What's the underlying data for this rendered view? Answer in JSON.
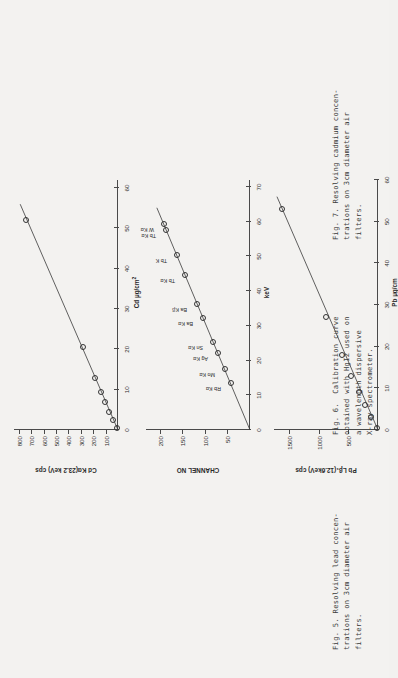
{
  "page": {
    "background": "#f3f2f0",
    "ink": "#333333",
    "orientation": "figures rotated 90 degrees counter-clockwise"
  },
  "figures": [
    {
      "id": "fig5",
      "caption_lines": [
        "Fig. 5. Resolving lead concen-",
        "trations on 3cm diameter air",
        "filters."
      ],
      "chart_data": {
        "type": "scatter",
        "title": "Fig. 5. Resolving lead concentrations on 3cm diameter air filters.",
        "xlabel": "Pb µg/cm",
        "ylabel": "Pb Lβ₁(12.6keV) cps",
        "xlim": [
          0,
          60
        ],
        "ylim": [
          0,
          1750
        ],
        "xticks": [
          0,
          10,
          20,
          30,
          40,
          50,
          60
        ],
        "yticks": [
          500,
          1000,
          1500
        ],
        "grid": false,
        "x": [
          0.5,
          3,
          6,
          9,
          13,
          18,
          27,
          53
        ],
        "y": [
          20,
          110,
          215,
          320,
          450,
          600,
          880,
          1610
        ],
        "fit_line": {
          "x0": 0,
          "y0": 0,
          "x1": 56,
          "y1": 1700
        }
      }
    },
    {
      "id": "fig6",
      "caption_lines": [
        "Fig. 6.  Calibration curve",
        "obtained with HgI2 used on",
        "a wavelength dispersive",
        "X-ray spectrometer."
      ],
      "chart_data": {
        "type": "scatter",
        "title": "Fig. 6. Calibration curve obtained with HgI2 used on a wavelength dispersive X-ray spectrometer.",
        "xlabel": "keV",
        "ylabel": "CHANNEL NO",
        "xlim": [
          0,
          72
        ],
        "ylim": [
          0,
          230
        ],
        "xticks": [
          0,
          10,
          20,
          30,
          40,
          50,
          60,
          70
        ],
        "yticks": [
          50,
          100,
          150,
          200
        ],
        "grid": false,
        "points": [
          {
            "label": "Rb Kα",
            "x": 13.4,
            "y": 42
          },
          {
            "label": "Mo Kα",
            "x": 17.5,
            "y": 56
          },
          {
            "label": "Ag Kα",
            "x": 22.2,
            "y": 71
          },
          {
            "label": "Sn Kα",
            "x": 25.3,
            "y": 81
          },
          {
            "label": "Ba Kα",
            "x": 32.2,
            "y": 103
          },
          {
            "label": "Ba Kβ",
            "x": 36.4,
            "y": 117
          },
          {
            "label": "Tb Kα",
            "x": 44.5,
            "y": 143
          },
          {
            "label": "Tb K",
            "x": 50.4,
            "y": 162
          },
          {
            "label": "Tb Kα",
            "x": 57.5,
            "y": 185
          },
          {
            "label": "W Kα",
            "x": 59.3,
            "y": 191
          }
        ],
        "fit_line": {
          "x0": 0,
          "y0": 0,
          "x1": 64,
          "y1": 206
        }
      }
    },
    {
      "id": "fig7",
      "caption_lines": [
        "Fig. 7. Resolving cadmium concen-",
        "trations on 3cm diameter air",
        "filters."
      ],
      "chart_data": {
        "type": "scatter",
        "title": "Fig. 7. Resolving cadmium concentrations on 3cm diameter air filters.",
        "xlabel": "Cd µg/cm",
        "xlabel_sup": "2",
        "ylabel": "Cd Kα(23.2 keV) cps",
        "xlim": [
          0,
          62
        ],
        "ylim": [
          0,
          840
        ],
        "xticks": [
          0,
          10,
          20,
          30,
          40,
          50,
          60
        ],
        "yticks": [
          100,
          200,
          300,
          400,
          500,
          600,
          700,
          800
        ],
        "grid": false,
        "x": [
          0.6,
          2.5,
          4.5,
          7,
          9.5,
          13,
          20.5,
          52
        ],
        "y": [
          10,
          42,
          70,
          104,
          140,
          185,
          285,
          740
        ],
        "fit_line": {
          "x0": 0,
          "y0": 0,
          "x1": 56,
          "y1": 790
        }
      }
    }
  ]
}
